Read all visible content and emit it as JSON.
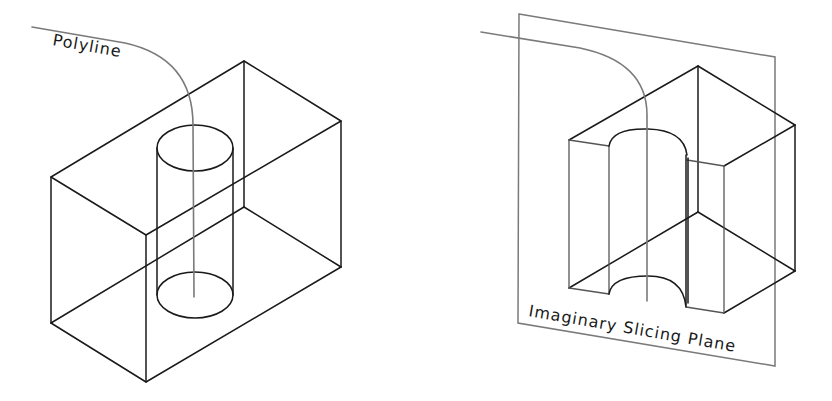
{
  "figures": [
    {
      "id": "left",
      "title": "Block with cylindrical hole and polyline path",
      "label": "Polyline"
    },
    {
      "id": "right",
      "title": "Block cut by imaginary slicing plane",
      "label": "Imaginary Slicing Plane"
    }
  ],
  "colors": {
    "edge": "#1a1a1a",
    "polyline": "#7a7a7a",
    "plane": "#7a7a7a",
    "background": "#ffffff"
  }
}
